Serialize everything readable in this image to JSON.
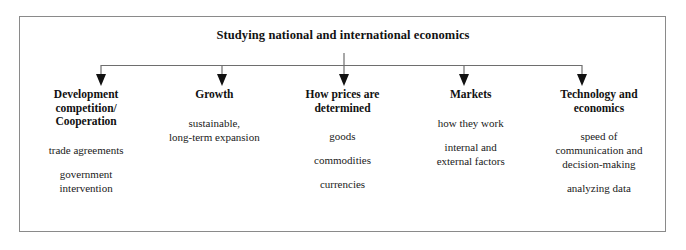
{
  "diagram": {
    "title": "Studying national and international economics",
    "type": "tree-hierarchy",
    "frame": {
      "border_color": "#8a8a8a",
      "background": "#ffffff"
    },
    "connector": {
      "color": "#6e6e6e",
      "arrow_color": "#111111",
      "bus_y": 65,
      "stem_top_y": 52,
      "arrow_tip_y": 86,
      "arrow_x_positions": [
        101,
        222,
        344,
        464,
        582
      ]
    },
    "branches": [
      {
        "id": "development",
        "heading": "Development\ncompetition/\nCooperation",
        "items": [
          "trade agreements",
          "government\nintervention"
        ]
      },
      {
        "id": "growth",
        "heading": "Growth",
        "items": [
          "sustainable,\nlong-term expansion"
        ]
      },
      {
        "id": "prices",
        "heading": "How prices are\ndetermined",
        "items": [
          "goods",
          "commodities",
          "currencies"
        ]
      },
      {
        "id": "markets",
        "heading": "Markets",
        "items": [
          "how they work",
          "internal and\nexternal factors"
        ]
      },
      {
        "id": "technology",
        "heading": "Technology and\neconomics",
        "items": [
          "speed of\ncommunication and\ndecision-making",
          "analyzing data"
        ]
      }
    ]
  }
}
